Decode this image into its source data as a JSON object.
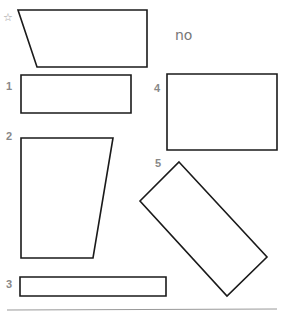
{
  "example": {
    "marker": "☆",
    "answer": "no",
    "points": "18,10 147,10 147,67 37,67"
  },
  "shapes": [
    {
      "label": "1",
      "points": "21,75 131,75 131,113 21,113"
    },
    {
      "label": "2",
      "points": "21,138 113,138 93,258 21,258"
    },
    {
      "label": "3",
      "points": "20,277 166,277 166,296 20,296"
    },
    {
      "label": "4",
      "points": "167,74 277,74 277,150 167,150"
    },
    {
      "label": "5",
      "points": "179,162 267,257 227,296 140,201"
    }
  ],
  "colors": {
    "stroke": "#1a1a1a",
    "label": "#888888",
    "rule": "#999999"
  }
}
